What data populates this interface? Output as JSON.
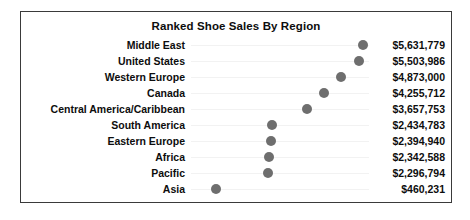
{
  "chart_data": {
    "type": "scatter",
    "title": "Ranked Shoe Sales By Region",
    "xlabel": "",
    "ylabel": "",
    "grid": false,
    "legend": "none",
    "value_prefix": "$",
    "categories": [
      "Middle East",
      "United States",
      "Western Europe",
      "Canada",
      "Central America/Caribbean",
      "South America",
      "Eastern Europe",
      "Africa",
      "Pacific",
      "Asia"
    ],
    "values": [
      5631779,
      5503986,
      4873000,
      4255712,
      3657753,
      2434783,
      2394940,
      2342588,
      2296794,
      460231
    ],
    "value_labels": [
      "$5,631,779",
      "$5,503,986",
      "$4,873,000",
      "$4,255,712",
      "$3,657,753",
      "$2,434,783",
      "$2,394,940",
      "$2,342,588",
      "$2,296,794",
      "$460,231"
    ],
    "xlim": [
      0,
      6000000
    ],
    "marker": "circle",
    "marker_color": "#6e6e6e",
    "connector_color": "#f2f2f2",
    "border_color": "#3a3a3a",
    "background_color": "#ffffff",
    "text_color": "#0d0d0d"
  }
}
